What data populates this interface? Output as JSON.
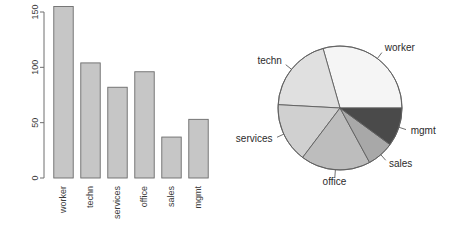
{
  "chart_data": [
    {
      "type": "bar",
      "title": "",
      "xlabel": "",
      "ylabel": "",
      "categories": [
        "worker",
        "techn",
        "services",
        "office",
        "sales",
        "mgmt"
      ],
      "values": [
        155,
        104,
        82,
        96,
        37,
        53
      ],
      "ylim": [
        0,
        150
      ],
      "yticks": [
        0,
        50,
        100,
        150
      ],
      "ytick_labels": [
        "0",
        "50",
        "100",
        "150"
      ],
      "grid": false,
      "legend": "none",
      "bar_fill": "#c6c6c6",
      "bar_border": "#6b6b6b",
      "axis_color": "#6e6e6e",
      "tick_label_rotation": -90,
      "category_label_rotation": -90
    },
    {
      "type": "pie",
      "title": "",
      "labels": [
        "worker",
        "techn",
        "services",
        "office",
        "sales",
        "mgmt"
      ],
      "values": [
        155,
        104,
        82,
        96,
        37,
        53
      ],
      "start_angle": 0,
      "direction": "counterclockwise",
      "legend": "none",
      "label_position": "outside",
      "slice_colors": [
        "#f5f5f5",
        "#e0e0e0",
        "#d0d0d0",
        "#bdbdbd",
        "#a8a8a8",
        "#4a4a4a"
      ],
      "slice_border": "#5f5f5f"
    }
  ],
  "bar_chart": {
    "name": "Employee counts by department",
    "y_axis": {
      "ticks": [
        {
          "label": "0",
          "value": 0
        },
        {
          "label": "50",
          "value": 50
        },
        {
          "label": "100",
          "value": 100
        },
        {
          "label": "150",
          "value": 150
        }
      ]
    },
    "bars": [
      {
        "label": "worker",
        "value": 155
      },
      {
        "label": "techn",
        "value": 104
      },
      {
        "label": "services",
        "value": 82
      },
      {
        "label": "office",
        "value": 96
      },
      {
        "label": "sales",
        "value": 37
      },
      {
        "label": "mgmt",
        "value": 53
      }
    ]
  },
  "pie_chart": {
    "name": "Employee share by department",
    "slices": [
      {
        "label": "worker",
        "value": 155,
        "color": "#f5f5f5"
      },
      {
        "label": "techn",
        "value": 104,
        "color": "#e0e0e0"
      },
      {
        "label": "services",
        "value": 82,
        "color": "#d0d0d0"
      },
      {
        "label": "office",
        "value": 96,
        "color": "#bdbdbd"
      },
      {
        "label": "sales",
        "value": 37,
        "color": "#a8a8a8"
      },
      {
        "label": "mgmt",
        "value": 53,
        "color": "#4a4a4a"
      }
    ]
  }
}
